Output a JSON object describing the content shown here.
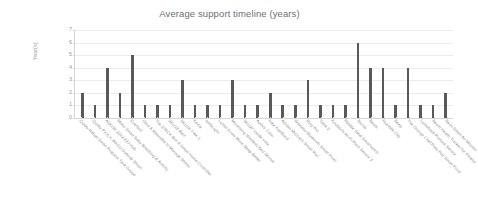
{
  "chart_data": {
    "type": "bar",
    "title": "Average support timeline (years)",
    "xlabel": "",
    "ylabel": "Year(s)",
    "ylim": [
      0,
      7
    ],
    "yticks": [
      0,
      1,
      2,
      3,
      4,
      5,
      6,
      7
    ],
    "grid": true,
    "legend": false,
    "bar_color": "#595959",
    "label_rotation": 45,
    "categories": [
      "Quirky Refuel Smart Propane Tank Gauge",
      "Quirky PX7LX-30HDJ Outlook Smart",
      "ASKON 2242-22J Hub",
      "Mimo Smart Baby Breathing & Activity",
      "Everbod",
      "Olive  A Wearable to Manage Stress",
      "The STACK Box  A Smart Home Controller",
      "SKU13 Alert",
      "SKU13 Y AK  1",
      "Kedar",
      "ambiLight",
      "Lumar Know More Sleep Better",
      "Monitoring Wireless Bed Sensor",
      "SKU27 Inside Vote",
      "Author  Colin",
      "Nike FuelBand",
      "Adidas MiCoach Smart Run",
      "Wireless Bluetooth Smart Food",
      "Ring Pro",
      "Table 2",
      "Koubachi Wi-Fi Plant Sensor 2",
      "Pebble Steel Smartwatch",
      "Bands",
      "Beats",
      "Nutribite Clip",
      "Beep",
      "The Orange Chef Prep Pad Smart Food",
      "Lumoback Posture Sensor",
      "Beam Health Tracker for Fitness",
      "Beds Smart Air Monitor"
    ],
    "values": [
      2,
      1,
      4,
      2,
      5,
      1,
      1,
      1,
      3,
      1,
      1,
      1,
      3,
      1,
      1,
      2,
      1,
      1,
      3,
      1,
      1,
      1,
      6,
      4,
      4,
      1,
      4,
      1,
      1,
      2
    ]
  }
}
